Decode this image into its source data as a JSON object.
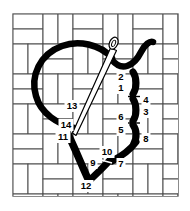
{
  "diagram": {
    "type": "needlework-stitch-diagram",
    "canvas": {
      "background_color": "#ffffff",
      "weave_line_color": "#4d4d4d",
      "weave_fill_color": "#ffffff",
      "grid_left": 13,
      "grid_top": 14,
      "grid_right": 178,
      "grid_bottom": 196,
      "weave_unit_px": 30,
      "weave_columns": 11,
      "weave_rows": 12
    },
    "thread": {
      "color": "#000000",
      "description": "thick black working thread forming a heart outline"
    },
    "needle": {
      "color_outline": "#000000",
      "color_fill": "#ffffff",
      "description": "threaded needle entering the canvas diagonally",
      "eye_label": "needle-eye",
      "tip_x": 73,
      "tip_y": 134,
      "eye_x": 113,
      "eye_y": 44
    },
    "stitch_numbers": [
      {
        "id": "1",
        "label": "1",
        "x": 121,
        "y": 88
      },
      {
        "id": "2",
        "label": "2",
        "x": 121,
        "y": 77
      },
      {
        "id": "3",
        "label": "3",
        "x": 146,
        "y": 112
      },
      {
        "id": "4",
        "label": "4",
        "x": 146,
        "y": 100
      },
      {
        "id": "5",
        "label": "5",
        "x": 121,
        "y": 130
      },
      {
        "id": "6",
        "label": "6",
        "x": 121,
        "y": 117
      },
      {
        "id": "7",
        "label": "7",
        "x": 121,
        "y": 164
      },
      {
        "id": "8",
        "label": "8",
        "x": 146,
        "y": 139
      },
      {
        "id": "9",
        "label": "9",
        "x": 93,
        "y": 163
      },
      {
        "id": "10",
        "label": "10",
        "x": 107,
        "y": 152
      },
      {
        "id": "11",
        "label": "11",
        "x": 63,
        "y": 137
      },
      {
        "id": "12",
        "label": "12",
        "x": 86,
        "y": 186
      },
      {
        "id": "13",
        "label": "13",
        "x": 72,
        "y": 106
      },
      {
        "id": "14",
        "label": "14",
        "x": 66,
        "y": 125
      }
    ]
  }
}
